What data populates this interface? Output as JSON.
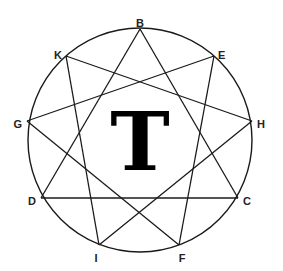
{
  "diagram": {
    "center_letter": "T",
    "circle": {
      "cx": 140,
      "cy": 140,
      "r": 112
    },
    "points": [
      {
        "id": "B",
        "label": "B",
        "x": 140,
        "y": 29,
        "lx": 140,
        "ly": 24,
        "anchor": "middle"
      },
      {
        "id": "E",
        "label": "E",
        "x": 214,
        "y": 56,
        "lx": 218,
        "ly": 56,
        "anchor": "start"
      },
      {
        "id": "H",
        "label": "H",
        "x": 252,
        "y": 121,
        "lx": 257,
        "ly": 125,
        "anchor": "start"
      },
      {
        "id": "C",
        "label": "C",
        "x": 238,
        "y": 198,
        "lx": 243,
        "ly": 202,
        "anchor": "start"
      },
      {
        "id": "F",
        "label": "F",
        "x": 179,
        "y": 245,
        "lx": 182,
        "ly": 259,
        "anchor": "middle"
      },
      {
        "id": "I",
        "label": "I",
        "x": 99,
        "y": 245,
        "lx": 96,
        "ly": 259,
        "anchor": "middle"
      },
      {
        "id": "D",
        "label": "D",
        "x": 41,
        "y": 198,
        "lx": 36,
        "ly": 202,
        "anchor": "end"
      },
      {
        "id": "G",
        "label": "G",
        "x": 27,
        "y": 121,
        "lx": 22,
        "ly": 125,
        "anchor": "end"
      },
      {
        "id": "K",
        "label": "K",
        "x": 66,
        "y": 56,
        "lx": 62,
        "ly": 56,
        "anchor": "end"
      }
    ],
    "edges": [
      [
        "B",
        "D"
      ],
      [
        "B",
        "C"
      ],
      [
        "K",
        "H"
      ],
      [
        "K",
        "I"
      ],
      [
        "E",
        "G"
      ],
      [
        "E",
        "F"
      ],
      [
        "G",
        "F"
      ],
      [
        "H",
        "I"
      ],
      [
        "D",
        "C"
      ]
    ],
    "stroke_color": "#1a1a1a"
  }
}
